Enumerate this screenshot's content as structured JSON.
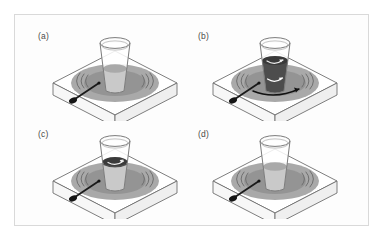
{
  "figure": {
    "background_color": "#ffffff",
    "frame_color": "#d9d9d9",
    "frame_background": "#fdfdfd"
  },
  "palette": {
    "outline": "#6f6f6f",
    "plate_top": "#ffffff",
    "plate_side": "#f2f2f2",
    "burner_outer": "#a8a8a8",
    "burner_inner": "#8f8f8f",
    "heat_wave": "#7d7d7d",
    "knob": "#1a1a1a",
    "glass_outline": "#7b7b7b",
    "liquid_light": "#c9c9c9",
    "liquid_light_surface": "#a9a9a9",
    "liquid_dark": "#4d4d4d",
    "liquid_dark_surface": "#3a3a3a",
    "arrow": "#111111"
  },
  "panels": [
    {
      "id": "a",
      "label": "(a)",
      "liquid_state": "uniform-light",
      "liquid_fill_color": "#c9c9c9",
      "liquid_surface_color": "#a9a9a9",
      "dark_layer": false,
      "arrows": []
    },
    {
      "id": "b",
      "label": "(b)",
      "liquid_state": "fully-dark-convecting",
      "liquid_fill_color": "#4d4d4d",
      "liquid_surface_color": "#3a3a3a",
      "dark_layer": true,
      "arrows": [
        "surface-swirl",
        "mid-swirl",
        "plate-swirl"
      ]
    },
    {
      "id": "c",
      "label": "(c)",
      "liquid_state": "dark-top-layer",
      "liquid_fill_color": "#c9c9c9",
      "liquid_surface_color": "#a9a9a9",
      "dark_layer": true,
      "arrows": [
        "surface-swirl"
      ]
    },
    {
      "id": "d",
      "label": "(d)",
      "liquid_state": "uniform-light",
      "liquid_fill_color": "#c9c9c9",
      "liquid_surface_color": "#a9a9a9",
      "dark_layer": false,
      "arrows": []
    }
  ],
  "scene_parts": {
    "hotplate": "hot-plate",
    "burner": "burner-ring",
    "knob": "control-knob",
    "glass": "drinking-glass",
    "heat_waves": "heat-wave-arcs"
  }
}
